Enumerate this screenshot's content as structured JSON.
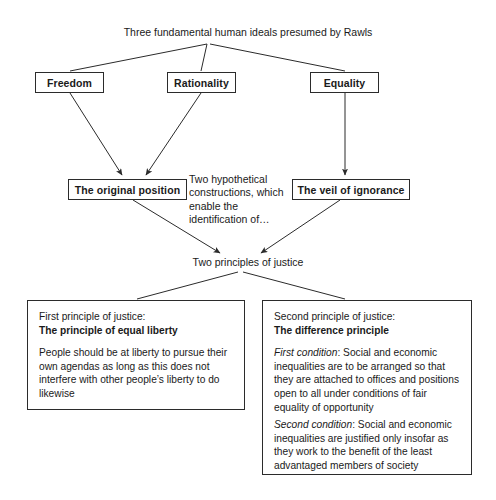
{
  "diagram": {
    "title": "Three fundamental human ideals presumed by Rawls",
    "ideals": [
      {
        "label": "Freedom"
      },
      {
        "label": "Rationality"
      },
      {
        "label": "Equality"
      }
    ],
    "constructions": [
      {
        "label": "The original position"
      },
      {
        "label": "The veil of ignorance"
      }
    ],
    "note_constructions": "Two hypothetical constructions, which enable the identification of…",
    "two_principles_label": "Two principles of justice",
    "first_principle": {
      "lead": "First principle of justice:",
      "title": "The principle of equal liberty",
      "body": "People should be at liberty to pursue their own agendas as long as this does not interfere with other people’s liberty to do likewise"
    },
    "second_principle": {
      "lead": "Second principle of justice:",
      "title": "The difference principle",
      "first_condition_label": "First condition",
      "first_condition_text": ": Social and economic inequalities are to be arranged so that they are  attached to offices and positions open to all under conditions of fair equality of opportunity",
      "second_condition_label": "Second condition",
      "second_condition_text": ": Social and economic inequalities are justified only insofar as they work to the benefit of the least advantaged members of society"
    },
    "colors": {
      "background": "#ffffff",
      "text": "#1a1a1a",
      "stroke": "#2b2b2b"
    }
  }
}
